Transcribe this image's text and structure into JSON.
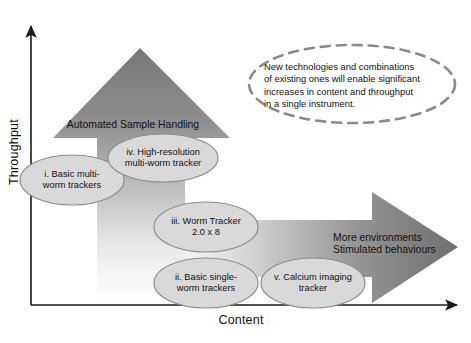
{
  "figure": {
    "background_color": "#ffffff",
    "text_color": "#111111"
  },
  "axes": {
    "y_label": "Throughput",
    "x_label": "Content",
    "axis_color": "#1a1a1a"
  },
  "arrows": [
    {
      "id": "throughput-arrow",
      "direction": "up",
      "label": "Automated Sample Handling",
      "gradient_from": "#7d7d7d",
      "gradient_to": "#ffffff"
    },
    {
      "id": "content-arrow",
      "direction": "right",
      "label": "More environments\nStimulated behaviours",
      "gradient_from": "#ffffff",
      "gradient_to": "#7b7b7b"
    }
  ],
  "callout": {
    "text": "New technologies and combinations\nof existing ones will enable significant\nincreases in content and throughput\nin a single instrument.",
    "border_color": "#8a8a8a",
    "border_style": "dashed"
  },
  "nodes": [
    {
      "id": "node-i",
      "label": "i. Basic multi-\nworm trackers"
    },
    {
      "id": "node-iv",
      "label": "iv. High-resolution\nmulti-worm tracker"
    },
    {
      "id": "node-iii",
      "label": "iii. Worm Tracker\n2.0 x 8"
    },
    {
      "id": "node-ii",
      "label": "ii. Basic single-\nworm trackers"
    },
    {
      "id": "node-v",
      "label": "v. Calcium imaging\ntracker"
    }
  ],
  "node_style": {
    "fill": "#d9d9d9",
    "stroke": "#8d8d8d"
  }
}
